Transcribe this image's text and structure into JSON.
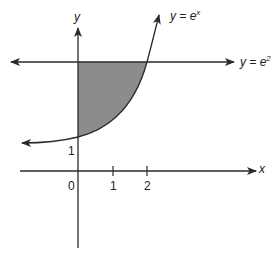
{
  "diagram": {
    "type": "graph",
    "colors": {
      "line": "#2a2a2a",
      "shade": "#8c8c8c",
      "background": "#ffffff"
    },
    "axes": {
      "x_label": "x",
      "y_label": "y",
      "origin_label": "0",
      "x_ticks": [
        "1",
        "2"
      ],
      "y_ticks": [
        "1"
      ]
    },
    "curves": [
      {
        "name": "exponential",
        "label_prefix": "y = e",
        "label_sup": "x"
      },
      {
        "name": "horizontal-line",
        "label_prefix": "y = e",
        "label_sup": "2"
      }
    ],
    "shaded_region": {
      "bounded_by": [
        "y-axis",
        "y = e^x",
        "y = e^2"
      ],
      "x_range": [
        0,
        2
      ]
    }
  }
}
